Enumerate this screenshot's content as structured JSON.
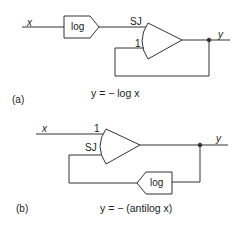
{
  "diagram_a": {
    "label": "(a)",
    "input_label": "x",
    "output_label": "y",
    "log_block_label": "log",
    "sj_label": "SJ",
    "input1_label": "1",
    "equation": "y = − log  x"
  },
  "diagram_b": {
    "label": "(b)",
    "input_label": "x",
    "output_label": "y",
    "log_block_label": "log",
    "sj_label": "SJ",
    "input1_label": "1",
    "equation": "y = − (antilog  x)"
  },
  "colors": {
    "line": "#333333",
    "text": "#222222",
    "background": "#ffffff"
  }
}
